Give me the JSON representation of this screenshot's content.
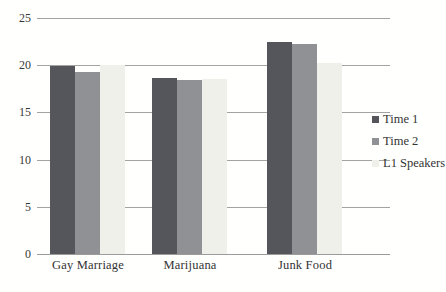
{
  "chart_data": {
    "type": "bar",
    "title": "",
    "xlabel": "",
    "ylabel": "",
    "categories": [
      "Gay Marriage",
      "Marijuana",
      "Junk Food"
    ],
    "series": [
      {
        "name": "Time 1",
        "color": "#54565b",
        "values": [
          19.9,
          18.6,
          22.5
        ]
      },
      {
        "name": "Time 2",
        "color": "#8f9195",
        "values": [
          19.3,
          18.4,
          22.3
        ]
      },
      {
        "name": "L1 Speakers",
        "color": "#eff0e9",
        "values": [
          20.0,
          18.5,
          20.2
        ]
      }
    ],
    "ylim": [
      0,
      25
    ],
    "yticks": [
      0,
      5,
      10,
      15,
      20,
      25
    ],
    "grid": true,
    "gridline_color": "#a3a3a3",
    "axis_line_color": "#9b9b9b",
    "text_color": "#333333",
    "legend_position": "right",
    "legend_labels": [
      "Time 1",
      "Time 2",
      "L1 Speakers"
    ]
  }
}
